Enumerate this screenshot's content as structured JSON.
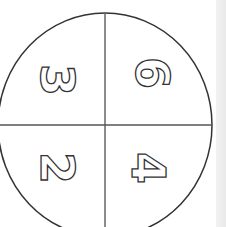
{
  "figure": {
    "stroke_color": "#333333",
    "divider_color": "#555555",
    "quadrants": [
      {
        "position": "top-left",
        "digit": "3",
        "rotation": 90
      },
      {
        "position": "top-right",
        "digit": "6",
        "rotation": 90
      },
      {
        "position": "bottom-left",
        "digit": "2",
        "rotation": 90
      },
      {
        "position": "bottom-right",
        "digit": "4",
        "rotation": 90
      }
    ]
  }
}
